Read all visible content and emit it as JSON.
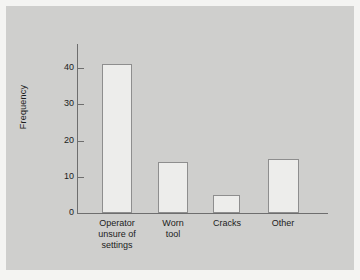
{
  "chart_data": {
    "type": "bar",
    "title": "",
    "subtitle": "",
    "xlabel": "",
    "ylabel": "Frequency",
    "categories": [
      "Operator unsure of settings",
      "Worn tool",
      "Cracks",
      "Other"
    ],
    "category_lines": [
      [
        "Operator",
        "unsure of",
        "settings"
      ],
      [
        "Worn",
        "tool"
      ],
      [
        "Cracks"
      ],
      [
        "Other"
      ]
    ],
    "values": [
      41,
      14,
      5,
      15
    ],
    "ylim": [
      0,
      45
    ],
    "yticks": [
      0,
      10,
      20,
      30,
      40
    ],
    "ytick_labels": [
      "0",
      "10",
      "20",
      "30",
      "40"
    ],
    "grid": false,
    "legend": null,
    "colors": {
      "panel_background": "#cfcfcd",
      "page_background": "#f4f4f2",
      "bar_fill": "#ededeb",
      "bar_border": "#8e8e8e",
      "axis": "#6e6e6e",
      "text": "#1c1c1c"
    }
  }
}
